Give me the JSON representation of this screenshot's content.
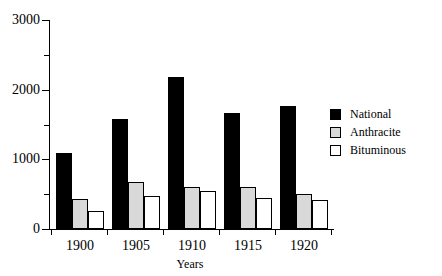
{
  "chart_data": {
    "type": "bar",
    "title": "",
    "subtitle": "",
    "xlabel": "Years",
    "ylabel": "",
    "categories": [
      "1900",
      "1905",
      "1910",
      "1915",
      "1920"
    ],
    "series": [
      {
        "name": "National",
        "color": "#000000",
        "values": [
          1090,
          1580,
          2180,
          1670,
          1760
        ]
      },
      {
        "name": "Anthracite",
        "color": "#d9d9d9",
        "values": [
          430,
          670,
          600,
          600,
          500
        ]
      },
      {
        "name": "Bituminous",
        "color": "#ffffff",
        "values": [
          260,
          480,
          550,
          440,
          420
        ]
      }
    ],
    "ylim": [
      0,
      3000
    ],
    "ytick_labels": [
      "0",
      "1000",
      "2000",
      "3000"
    ],
    "ytick_values": [
      0,
      1000,
      2000,
      3000
    ],
    "yminor_tick_values": [
      500,
      1500,
      2500
    ],
    "grid": false,
    "legend_position": "right"
  },
  "legend": {
    "entries": [
      {
        "label": "National"
      },
      {
        "label": "Anthracite"
      },
      {
        "label": "Bituminous"
      }
    ]
  },
  "axes": {
    "x_title": "Years",
    "x_tick_labels": [
      "1900",
      "1905",
      "1910",
      "1915",
      "1920"
    ],
    "y_tick_labels": [
      "3000",
      "2000",
      "1000",
      "0"
    ]
  }
}
